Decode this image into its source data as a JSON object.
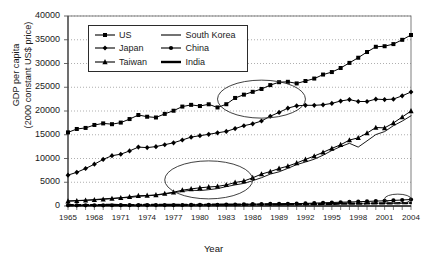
{
  "chart_data": {
    "type": "line",
    "title": "",
    "xlabel": "Year",
    "ylabel": "GDP per capita\n(2000 constant US$ price)",
    "ylabel_line1": "GDP per capita",
    "ylabel_line2": "(2000 constant US$ price)",
    "xlim": [
      1965,
      2004
    ],
    "ylim": [
      0,
      40000
    ],
    "ytick_step": 5000,
    "xtick_step": 3,
    "grid": "horizontal-dotted",
    "legend_position": "top-left-inside",
    "ytick_labels": [
      "0",
      "5000",
      "10000",
      "15000",
      "20000",
      "25000",
      "30000",
      "35000",
      "40000"
    ],
    "ytick_values": [
      0,
      5000,
      10000,
      15000,
      20000,
      25000,
      30000,
      35000,
      40000
    ],
    "xtick_labels": [
      "1965",
      "1968",
      "1971",
      "1974",
      "1977",
      "1980",
      "1983",
      "1986",
      "1989",
      "1992",
      "1995",
      "1998",
      "2001",
      "2004"
    ],
    "xtick_values": [
      1965,
      1968,
      1971,
      1974,
      1977,
      1980,
      1983,
      1986,
      1989,
      1992,
      1995,
      1998,
      2001,
      2004
    ],
    "x": [
      1965,
      1966,
      1967,
      1968,
      1969,
      1970,
      1971,
      1972,
      1973,
      1974,
      1975,
      1976,
      1977,
      1978,
      1979,
      1980,
      1981,
      1982,
      1983,
      1984,
      1985,
      1986,
      1987,
      1988,
      1989,
      1990,
      1991,
      1992,
      1993,
      1994,
      1995,
      1996,
      1997,
      1998,
      1999,
      2000,
      2001,
      2002,
      2003,
      2004
    ],
    "series": [
      {
        "name": "US",
        "marker": "square",
        "line": "solid",
        "color": "#000000",
        "values": [
          15500,
          16200,
          16400,
          17000,
          17300,
          17100,
          17400,
          18100,
          18900,
          18500,
          18300,
          19000,
          19600,
          20400,
          20700,
          20400,
          20700,
          20000,
          20600,
          21800,
          22400,
          22900,
          23400,
          24100,
          24600,
          24600,
          24200,
          24600,
          25000,
          25700,
          26100,
          26800,
          27700,
          28600,
          29600,
          30500,
          30500,
          30800,
          31500,
          32300
        ],
        "last_value": 36000,
        "end_values_note": "US rises to about 36000 by 2004"
      },
      {
        "name": "Japan",
        "marker": "diamond",
        "line": "solid",
        "color": "#000000",
        "values": [
          6500,
          7100,
          7900,
          8800,
          9800,
          10600,
          10900,
          11600,
          12400,
          12300,
          12500,
          12900,
          13300,
          13900,
          14500,
          14800,
          15100,
          15400,
          15700,
          16300,
          16900,
          17300,
          17900,
          18900,
          19700,
          20600,
          21100,
          21200,
          21200,
          21300,
          21600,
          22100,
          22400,
          22000,
          22000,
          22500,
          22400,
          22500,
          23200,
          24000
        ],
        "last_value": 24000
      },
      {
        "name": "Taiwan",
        "marker": "triangle",
        "line": "solid",
        "color": "#000000",
        "values": [
          1000,
          1080,
          1180,
          1260,
          1360,
          1480,
          1630,
          1810,
          2010,
          2030,
          2100,
          2330,
          2550,
          2890,
          3070,
          3220,
          3320,
          3380,
          3590,
          3930,
          4130,
          4590,
          5110,
          5440,
          5830,
          6120,
          6500,
          6930,
          7330,
          7760,
          8200,
          8600,
          9120,
          9300,
          9800,
          10400,
          10200,
          10700,
          11300,
          11900
        ],
        "last_value": 20000,
        "end_values_note": "Taiwan reaches about 20000 by 2004"
      },
      {
        "name": "South Korea",
        "marker": "none",
        "line": "solid-thin",
        "color": "#000000",
        "values": [
          1100,
          1150,
          1210,
          1320,
          1470,
          1560,
          1650,
          1710,
          1900,
          2000,
          2090,
          2300,
          2520,
          2750,
          2930,
          2830,
          2960,
          3120,
          3440,
          3700,
          3910,
          4330,
          4790,
          5330,
          5640,
          6150,
          6660,
          7000,
          7350,
          7890,
          8500,
          8990,
          9380,
          8700,
          9500,
          10300,
          10600,
          11300,
          11800,
          12400
        ],
        "last_value": 19000,
        "event_note": "dip in 1998 Asian financial crisis"
      },
      {
        "name": "China",
        "marker": "circle",
        "line": "solid",
        "color": "#000000",
        "values": [
          150,
          150,
          140,
          140,
          150,
          160,
          170,
          175,
          180,
          180,
          190,
          185,
          195,
          210,
          225,
          240,
          250,
          265,
          290,
          320,
          355,
          375,
          405,
          440,
          450,
          465,
          495,
          550,
          605,
          670,
          730,
          790,
          850,
          905,
          960,
          1030,
          1100,
          1170,
          1260,
          1360
        ],
        "last_value": 1360
      },
      {
        "name": "India",
        "marker": "none",
        "line": "thick-dashed",
        "color": "#000000",
        "values": [
          200,
          195,
          205,
          210,
          215,
          225,
          220,
          215,
          220,
          225,
          235,
          235,
          250,
          260,
          245,
          255,
          265,
          270,
          280,
          290,
          300,
          310,
          320,
          340,
          360,
          380,
          380,
          390,
          405,
          425,
          450,
          475,
          490,
          510,
          535,
          550,
          565,
          575,
          605,
          640
        ],
        "last_value": 640
      }
    ],
    "annotations": [
      {
        "type": "ellipse",
        "name": "us-japan-convergence-ellipse",
        "x_range": [
          1982,
          1992
        ],
        "y_range": [
          18500,
          26500
        ]
      },
      {
        "type": "ellipse",
        "name": "taiwan-south-korea-ellipse",
        "x_range": [
          1976,
          1986
        ],
        "y_range": [
          1500,
          9500
        ]
      },
      {
        "type": "ellipse",
        "name": "china-india-ellipse",
        "x_range": [
          2001,
          2004
        ],
        "y_range": [
          500,
          2500
        ]
      }
    ]
  },
  "legend": {
    "entries": [
      {
        "label": "US",
        "symbol": "square"
      },
      {
        "label": "South Korea",
        "symbol": "line"
      },
      {
        "label": "Japan",
        "symbol": "diamond"
      },
      {
        "label": "China",
        "symbol": "circle"
      },
      {
        "label": "Taiwan",
        "symbol": "triangle"
      },
      {
        "label": "India",
        "symbol": "thickline"
      }
    ]
  }
}
